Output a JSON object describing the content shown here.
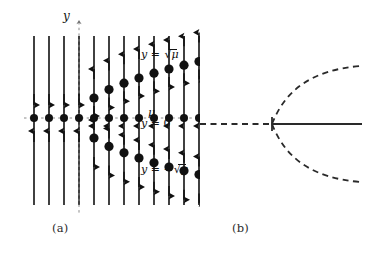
{
  "figure": {
    "kind": "pitchfork-bifurcation-figure",
    "background_color": "#ffffff",
    "ink_color": "#111111",
    "captions": {
      "panel_a": "(a)",
      "panel_b": "(b)"
    }
  },
  "panel_a": {
    "title": "phase portraits on vertical lines",
    "axis_labels": {
      "vertical_axis": "y",
      "horizontal_axis": "μ",
      "branch_upper": "y = √μ",
      "branch_center": "y = 0",
      "branch_lower": "y = −√μ"
    },
    "label_parts": {
      "y_var": "y",
      "equals": "=",
      "minus": "−",
      "mu": "μ",
      "zero": "0",
      "radical": "√"
    },
    "geometry": {
      "line_count": 12,
      "first_line_x": 34,
      "line_spacing": 15.0,
      "line_top_y": 36,
      "line_bottom_y": 205,
      "axis_y": 118,
      "y_axis_line_index": 3,
      "bifurcation_line_index": 4,
      "dot_radius_axis": 4.0,
      "dot_radius_branch": 4.6,
      "parabola_scale": 14.2
    },
    "fixed_points_on_axis_count": 12,
    "branch_points": [
      {
        "line_index": 4,
        "mu": 1,
        "y_offset": 20.0
      },
      {
        "line_index": 5,
        "mu": 2,
        "y_offset": 28.4
      },
      {
        "line_index": 6,
        "mu": 3,
        "y_offset": 34.8
      },
      {
        "line_index": 7,
        "mu": 4,
        "y_offset": 40.0
      },
      {
        "line_index": 8,
        "mu": 5,
        "y_offset": 44.8
      },
      {
        "line_index": 9,
        "mu": 6,
        "y_offset": 49.0
      },
      {
        "line_index": 10,
        "mu": 7,
        "y_offset": 52.8
      },
      {
        "line_index": 11,
        "mu": 8,
        "y_offset": 56.5
      }
    ],
    "flow_arrow_legend": {
      "above_upper_branch": "up",
      "between_upper_branch_and_zero": "down",
      "between_zero_and_lower_branch": "up",
      "below_lower_branch": "down",
      "left_of_bifurcation_above_zero": "up",
      "left_of_bifurcation_below_zero": "down"
    }
  },
  "panel_b": {
    "title": "bifurcation diagram",
    "geometry": {
      "bifurcation_point_x": 272,
      "bifurcation_point_y": 124,
      "left_branch_start_x": 200,
      "right_branch_end_x": 362,
      "parabola_end_x": 360,
      "parabola_half_height": 58
    },
    "branches": [
      {
        "name": "trivial-left",
        "style": "dashed",
        "stability": "unstable-drawn-dashed"
      },
      {
        "name": "trivial-right",
        "style": "solid",
        "stability": "stable-drawn-solid"
      },
      {
        "name": "upper-parabola",
        "style": "dashed",
        "stability": "drawn-dashed"
      },
      {
        "name": "lower-parabola",
        "style": "dashed",
        "stability": "drawn-dashed"
      }
    ]
  }
}
